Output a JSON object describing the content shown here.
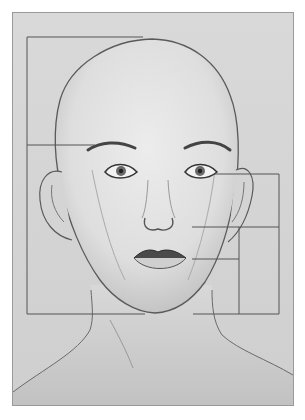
{
  "image": {
    "subject": "pencil drawing of a bald head with facial proportion guide lines",
    "medium": "graphite on grey paper",
    "colors": {
      "paper": "#d6d6d6",
      "border": "#9a9a9a",
      "line": "#555555",
      "skin_light": "#e8e8e8",
      "shading": "#8a8a8a"
    },
    "guides": {
      "left_bracket": {
        "top_y": 37,
        "brow_y": 145,
        "bottom_y": 314,
        "x": 27
      },
      "right_bracket": {
        "eye_y": 174,
        "nose_y": 227,
        "mouth_y": 259,
        "chin_y": 314,
        "outer_x": 279,
        "inner_x": 239
      }
    }
  }
}
